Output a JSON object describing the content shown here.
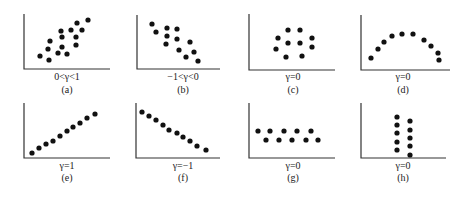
{
  "figure": {
    "panels": [
      {
        "id": "a",
        "condition": "0<γ<1",
        "caption": "(a)",
        "axis": {
          "x": 24,
          "top": 14,
          "bottom": 69,
          "right": 110
        },
        "labelX": 67,
        "labelY": 80,
        "captionY": 93,
        "points": [
          [
            88,
            20
          ],
          [
            77,
            23
          ],
          [
            71,
            30
          ],
          [
            82,
            30
          ],
          [
            61,
            31
          ],
          [
            76,
            37
          ],
          [
            62,
            37
          ],
          [
            50,
            41
          ],
          [
            76,
            45
          ],
          [
            62,
            47
          ],
          [
            48,
            49
          ],
          [
            58,
            53
          ],
          [
            67,
            54
          ],
          [
            40,
            56
          ],
          [
            49,
            60
          ]
        ]
      },
      {
        "id": "b",
        "condition": "−1<γ<0",
        "caption": "(b)",
        "axis": {
          "x": 137,
          "top": 15,
          "bottom": 69,
          "right": 220
        },
        "labelX": 183,
        "labelY": 80,
        "captionY": 93,
        "points": [
          [
            152,
            24
          ],
          [
            156,
            32
          ],
          [
            167,
            28
          ],
          [
            177,
            29
          ],
          [
            167,
            36
          ],
          [
            177,
            39
          ],
          [
            166,
            44
          ],
          [
            190,
            42
          ],
          [
            179,
            50
          ],
          [
            194,
            52
          ],
          [
            186,
            57
          ],
          [
            198,
            61
          ]
        ]
      },
      {
        "id": "c",
        "condition": "γ=0",
        "caption": "(c)",
        "axis": {
          "x": 249,
          "top": 14,
          "bottom": 70,
          "right": 335
        },
        "labelX": 293,
        "labelY": 80,
        "captionY": 93,
        "points": [
          [
            288,
            30
          ],
          [
            300,
            30
          ],
          [
            278,
            38
          ],
          [
            288,
            43
          ],
          [
            300,
            43
          ],
          [
            312,
            38
          ],
          [
            312,
            47
          ],
          [
            276,
            49
          ],
          [
            286,
            57
          ],
          [
            302,
            56
          ]
        ]
      },
      {
        "id": "d",
        "condition": "γ=0",
        "caption": "(d)",
        "axis": {
          "x": 361,
          "top": 15,
          "bottom": 70,
          "right": 450
        },
        "labelX": 403,
        "labelY": 80,
        "captionY": 93,
        "points": [
          [
            371,
            58
          ],
          [
            378,
            49
          ],
          [
            384,
            42
          ],
          [
            392,
            36
          ],
          [
            402,
            34
          ],
          [
            413,
            34
          ],
          [
            424,
            40
          ],
          [
            431,
            46
          ],
          [
            438,
            53
          ],
          [
            439,
            60
          ]
        ]
      },
      {
        "id": "e",
        "condition": "γ=1",
        "caption": "(e)",
        "axis": {
          "x": 24,
          "top": 103,
          "bottom": 158,
          "right": 110
        },
        "labelX": 67,
        "labelY": 169,
        "captionY": 181,
        "points": [
          [
            32,
            153
          ],
          [
            39,
            148
          ],
          [
            46,
            144
          ],
          [
            53,
            141
          ],
          [
            60,
            136
          ],
          [
            67,
            131
          ],
          [
            73,
            127
          ],
          [
            80,
            123
          ],
          [
            87,
            118
          ],
          [
            95,
            114
          ]
        ]
      },
      {
        "id": "f",
        "condition": "γ=−1",
        "caption": "(f)",
        "axis": {
          "x": 136,
          "top": 103,
          "bottom": 158,
          "right": 220
        },
        "labelX": 183,
        "labelY": 169,
        "captionY": 181,
        "points": [
          [
            142,
            112
          ],
          [
            149,
            116
          ],
          [
            156,
            120
          ],
          [
            163,
            125
          ],
          [
            169,
            130
          ],
          [
            177,
            133
          ],
          [
            183,
            137
          ],
          [
            190,
            141
          ],
          [
            197,
            146
          ],
          [
            206,
            150
          ]
        ]
      },
      {
        "id": "g",
        "condition": "γ=0",
        "caption": "(g)",
        "axis": {
          "x": 249,
          "top": 103,
          "bottom": 158,
          "right": 335
        },
        "labelX": 293,
        "labelY": 169,
        "captionY": 181,
        "points": [
          [
            258,
            131
          ],
          [
            270,
            131
          ],
          [
            284,
            131
          ],
          [
            297,
            131
          ],
          [
            311,
            131
          ],
          [
            266,
            140
          ],
          [
            279,
            140
          ],
          [
            292,
            140
          ],
          [
            306,
            140
          ],
          [
            318,
            140
          ]
        ]
      },
      {
        "id": "h",
        "condition": "γ=0",
        "caption": "(h)",
        "axis": {
          "x": 361,
          "top": 103,
          "bottom": 158,
          "right": 446
        },
        "labelX": 403,
        "labelY": 169,
        "captionY": 181,
        "points": [
          [
            397,
            117
          ],
          [
            397,
            125
          ],
          [
            397,
            133
          ],
          [
            397,
            142
          ],
          [
            397,
            150
          ],
          [
            410,
            121
          ],
          [
            410,
            130
          ],
          [
            410,
            138
          ],
          [
            410,
            146
          ],
          [
            410,
            155
          ]
        ]
      }
    ],
    "dot_color": "#111111",
    "axis_color": "#333333"
  }
}
